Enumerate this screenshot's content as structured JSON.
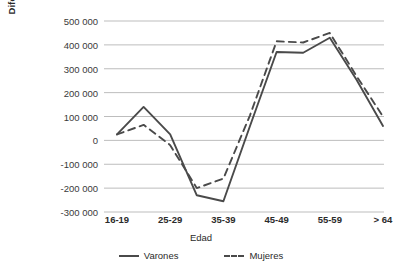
{
  "chart_data": {
    "type": "line",
    "title": "",
    "xlabel": "Edad",
    "ylabel": "Diferencia en número\nde afiliados",
    "categories": [
      "16-19",
      "20-24",
      "25-29",
      "30-34",
      "35-39",
      "40-44",
      "45-49",
      "50-54",
      "55-59",
      "60-64",
      "> 64"
    ],
    "tick_labels_shown": [
      "16-19",
      "25-29",
      "35-39",
      "45-49",
      "55-59",
      "> 64"
    ],
    "ylim": [
      -300000,
      500000
    ],
    "yticks": [
      500000,
      400000,
      300000,
      200000,
      100000,
      0,
      -100000,
      -200000,
      -300000
    ],
    "ytick_labels": [
      "500 000",
      "400 000",
      "300 000",
      "200 000",
      "100 000",
      "0",
      "-100 000",
      "-200 000",
      "-300 000"
    ],
    "grid": true,
    "legend_position": "bottom",
    "series": [
      {
        "name": "Varones",
        "style": "solid",
        "color": "#4a4a4a",
        "values": [
          25000,
          140000,
          25000,
          -230000,
          -255000,
          60000,
          370000,
          367000,
          430000,
          255000,
          60000
        ]
      },
      {
        "name": "Mujeres",
        "style": "dashed",
        "color": "#4a4a4a",
        "values": [
          25000,
          65000,
          -20000,
          -200000,
          -160000,
          105000,
          415000,
          410000,
          450000,
          270000,
          100000
        ]
      }
    ]
  },
  "legend": {
    "items": [
      {
        "label": "Varones",
        "style": "solid"
      },
      {
        "label": "Mujeres",
        "style": "dashed"
      }
    ]
  },
  "colors": {
    "line": "#4a4a4a",
    "grid": "#bdbdbd",
    "text": "#2b2b2b",
    "background": "#ffffff"
  }
}
